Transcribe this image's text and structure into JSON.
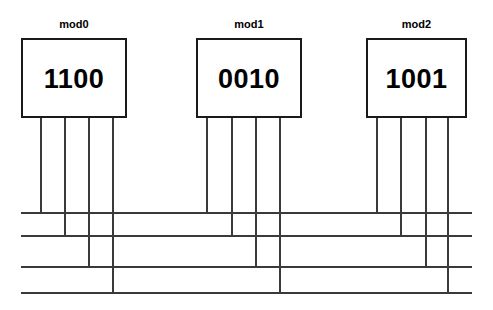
{
  "diagram": {
    "canvas": {
      "width": 493,
      "height": 310,
      "background": "#ffffff"
    },
    "line_color": "#3a3a3a",
    "box_border_color": "#1a1a1a",
    "text_color": "#000000",
    "modules": [
      {
        "id": "mod0",
        "label": "mod0",
        "value": "1100",
        "box": {
          "x": 21,
          "y": 38,
          "width": 106,
          "height": 80
        },
        "label_y": 18,
        "pins": [
          {
            "index": 0,
            "bit": "1",
            "x": 40,
            "bus": 0
          },
          {
            "index": 1,
            "bit": "1",
            "x": 64,
            "bus": 1
          },
          {
            "index": 2,
            "bit": "0",
            "x": 88,
            "bus": 2
          },
          {
            "index": 3,
            "bit": "0",
            "x": 112,
            "bus": 3
          }
        ]
      },
      {
        "id": "mod1",
        "label": "mod1",
        "value": "0010",
        "box": {
          "x": 196,
          "y": 38,
          "width": 106,
          "height": 80
        },
        "label_y": 18,
        "pins": [
          {
            "index": 0,
            "bit": "0",
            "x": 206,
            "bus": 0
          },
          {
            "index": 1,
            "bit": "0",
            "x": 231,
            "bus": 1
          },
          {
            "index": 2,
            "bit": "1",
            "x": 255,
            "bus": 2
          },
          {
            "index": 3,
            "bit": "0",
            "x": 279,
            "bus": 3
          }
        ]
      },
      {
        "id": "mod2",
        "label": "mod2",
        "value": "1001",
        "box": {
          "x": 366,
          "y": 38,
          "width": 101,
          "height": 80
        },
        "label_y": 18,
        "pins": [
          {
            "index": 0,
            "bit": "1",
            "x": 376,
            "bus": 0
          },
          {
            "index": 1,
            "bit": "0",
            "x": 400,
            "bus": 1
          },
          {
            "index": 2,
            "bit": "0",
            "x": 425,
            "bus": 2
          },
          {
            "index": 3,
            "bit": "1",
            "x": 447,
            "bus": 3
          }
        ]
      }
    ],
    "buses": [
      {
        "index": 0,
        "y": 212,
        "x_start": 21,
        "x_end": 472
      },
      {
        "index": 1,
        "y": 235,
        "x_start": 21,
        "x_end": 472
      },
      {
        "index": 2,
        "y": 266,
        "x_start": 21,
        "x_end": 472
      },
      {
        "index": 3,
        "y": 292,
        "x_start": 21,
        "x_end": 472
      }
    ]
  }
}
